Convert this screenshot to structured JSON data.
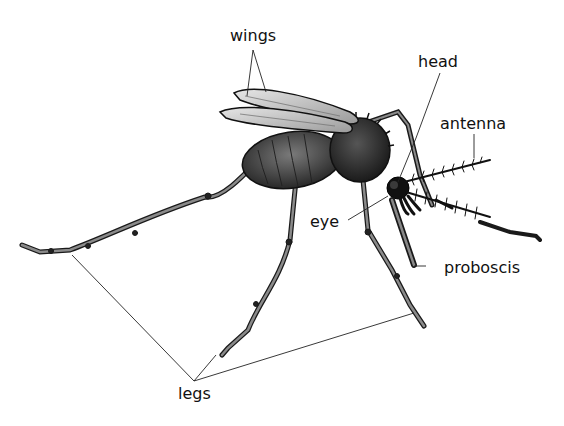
{
  "diagram": {
    "labels": {
      "wings": "wings",
      "head": "head",
      "antenna": "antenna",
      "eye": "eye",
      "proboscis": "proboscis",
      "legs": "legs"
    },
    "colors": {
      "background": "#ffffff",
      "line": "#222222",
      "body_dark": "#1e1e1e",
      "body_mid": "#4a4a4a",
      "wing_fill": "#cfcfcf",
      "leg_fill": "#6a6a6a"
    }
  }
}
